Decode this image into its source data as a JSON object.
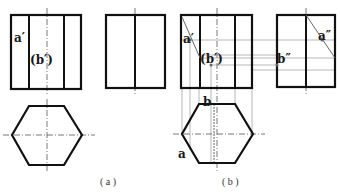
{
  "figure": {
    "colors": {
      "outline": "#111111",
      "guide": "#9a9a9a",
      "centerline": "#555555",
      "label": "#1a1a1a"
    }
  },
  "panel_a": {
    "caption": "( a )",
    "front_view": {
      "labels": {
        "a": "a′",
        "b": "(b′)"
      }
    },
    "side_view": {},
    "top_view": {}
  },
  "panel_b": {
    "caption": "( b )",
    "front_view": {
      "labels": {
        "a": "a′",
        "b": "(b′)"
      }
    },
    "side_view": {
      "labels": {
        "a": "a″",
        "b": "b″"
      }
    },
    "top_view": {
      "labels": {
        "a": "a",
        "b": "b"
      }
    }
  }
}
